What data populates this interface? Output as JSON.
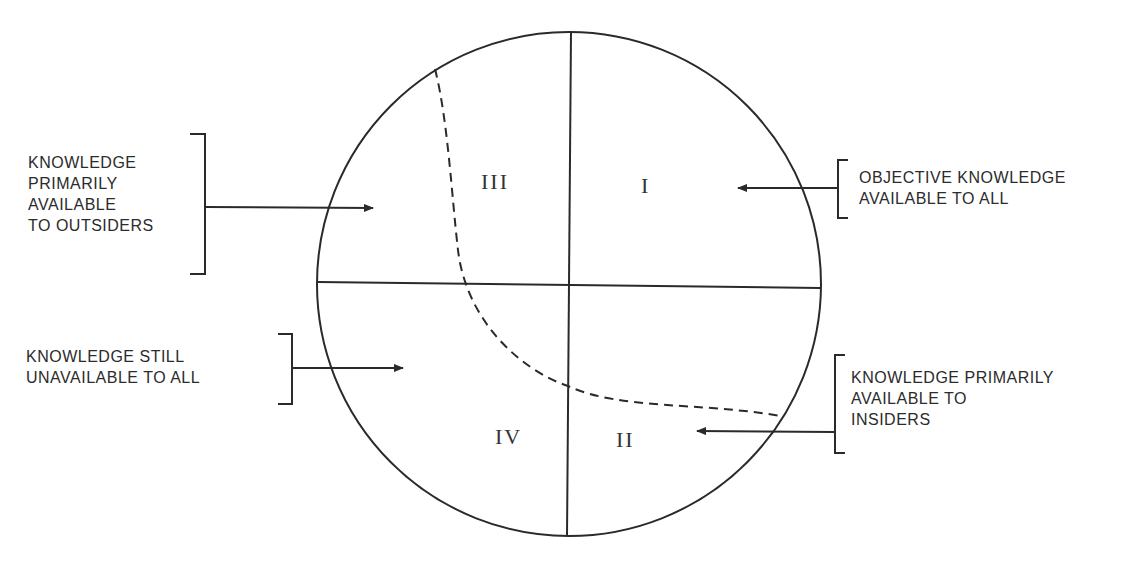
{
  "diagram": {
    "type": "quadrant-circle",
    "quadrants": {
      "I": "I",
      "II": "II",
      "III": "III",
      "IV": "IV"
    },
    "labels": {
      "outsiders": [
        "KNOWLEDGE",
        "PRIMARILY",
        "AVAILABLE",
        "TO OUTSIDERS"
      ],
      "objective": [
        "OBJECTIVE KNOWLEDGE",
        "AVAILABLE TO ALL"
      ],
      "unavailable": [
        "KNOWLEDGE STILL",
        "UNAVAILABLE TO ALL"
      ],
      "insiders": [
        "KNOWLEDGE PRIMARILY",
        "AVAILABLE TO",
        "INSIDERS"
      ]
    },
    "colors": {
      "stroke": "#2a2a2a",
      "background": "#ffffff"
    }
  }
}
